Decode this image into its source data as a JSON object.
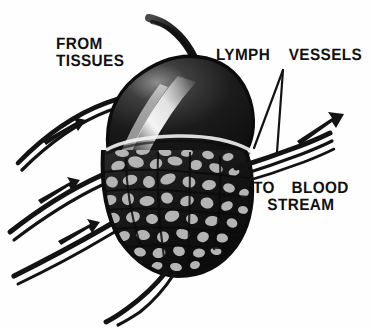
{
  "figure": {
    "background_color": "#fefefe",
    "ink_color": "#111111",
    "width": 371,
    "height": 328
  },
  "labels": {
    "from_tissues": {
      "line1": "FROM",
      "line2": "TISSUES",
      "text": "FROM\nTISSUES"
    },
    "lymph_vessels": {
      "text": "LYMPH  VESSELS"
    },
    "to_blood_stream": {
      "line1": "TO  BLOOD",
      "line2": "STREAM",
      "text": "TO  BLOOD\nSTREAM"
    }
  },
  "anatomy": {
    "node_capsule_name": "lymph-node-upper-capsule",
    "node_medulla_name": "lymph-node-medulla",
    "afferent_vessel_count": 3,
    "efferent_vessel_count": 1,
    "arrow_count": 4
  },
  "colors": {
    "ink": "#111111",
    "dark_fill": "#161616",
    "mid_gray": "#6e6e6e",
    "light_gray": "#b9b9b9",
    "highlight": "#fbfbfb",
    "paper": "#fefefe"
  }
}
